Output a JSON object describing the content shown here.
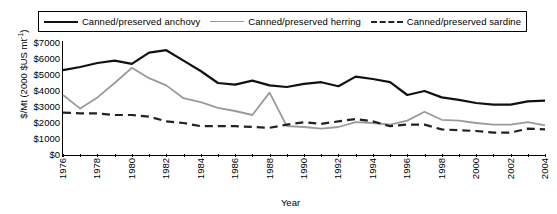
{
  "chart_data": {
    "type": "line",
    "title": "",
    "xlabel": "Year",
    "ylabel": "$/Mt (2000 $US mt⁻¹)",
    "ylabel_prefix": "$/Mt (2000 $US mt",
    "ylabel_sup": "-1",
    "ylabel_suffix": ")",
    "xlim": [
      1976,
      2004
    ],
    "ylim": [
      0,
      7000
    ],
    "ytick_labels": [
      "$7000",
      "$6000",
      "$5000",
      "$4000",
      "$3000",
      "$2000",
      "$1000",
      "$0"
    ],
    "ytick_values": [
      7000,
      6000,
      5000,
      4000,
      3000,
      2000,
      1000,
      0
    ],
    "xtick_labels": [
      "1976",
      "1978",
      "1980",
      "1982",
      "1984",
      "1986",
      "1988",
      "1990",
      "1992",
      "1994",
      "1996",
      "1998",
      "2000",
      "2002",
      "2004"
    ],
    "xtick_values": [
      1976,
      1978,
      1980,
      1982,
      1984,
      1986,
      1988,
      1990,
      1992,
      1994,
      1996,
      1998,
      2000,
      2002,
      2004
    ],
    "x": [
      1976,
      1977,
      1978,
      1979,
      1980,
      1981,
      1982,
      1983,
      1984,
      1985,
      1986,
      1987,
      1988,
      1989,
      1990,
      1991,
      1992,
      1993,
      1994,
      1995,
      1996,
      1997,
      1998,
      1999,
      2000,
      2001,
      2002,
      2003,
      2004
    ],
    "grid": false,
    "legend_position": "top",
    "series": [
      {
        "name": "Canned/preserved anchovy",
        "style": "solid",
        "color": "#111111",
        "width": 2.2,
        "values": [
          5300,
          5500,
          5750,
          5900,
          5700,
          6400,
          6550,
          5900,
          5250,
          4500,
          4400,
          4650,
          4350,
          4250,
          4450,
          4550,
          4300,
          4900,
          4750,
          4550,
          3750,
          4000,
          3600,
          3450,
          3250,
          3150,
          3150,
          3350,
          3400
        ]
      },
      {
        "name": "Canned/preserved herring",
        "style": "solid",
        "color": "#9a9a9a",
        "width": 1.8,
        "values": [
          3750,
          2900,
          3600,
          4500,
          5450,
          4800,
          4350,
          3550,
          3300,
          2950,
          2750,
          2500,
          3900,
          1800,
          1750,
          1650,
          1750,
          2050,
          2000,
          1900,
          2150,
          2700,
          2200,
          2150,
          2000,
          1900,
          1900,
          2050,
          1850
        ]
      },
      {
        "name": "Canned/preserved sardine",
        "style": "dashed",
        "color": "#222222",
        "width": 2.2,
        "values": [
          2650,
          2600,
          2600,
          2500,
          2500,
          2400,
          2100,
          2000,
          1800,
          1800,
          1800,
          1750,
          1700,
          1900,
          2050,
          1950,
          2100,
          2250,
          2100,
          1800,
          1900,
          1900,
          1600,
          1550,
          1500,
          1400,
          1400,
          1650,
          1600
        ]
      }
    ]
  },
  "legend": {
    "items": [
      {
        "label": "Canned/preserved anchovy",
        "key": "solid-dark-line-icon"
      },
      {
        "label": "Canned/preserved herring",
        "key": "solid-grey-line-icon"
      },
      {
        "label": "Canned/preserved sardine",
        "key": "dashed-dark-line-icon"
      }
    ]
  }
}
